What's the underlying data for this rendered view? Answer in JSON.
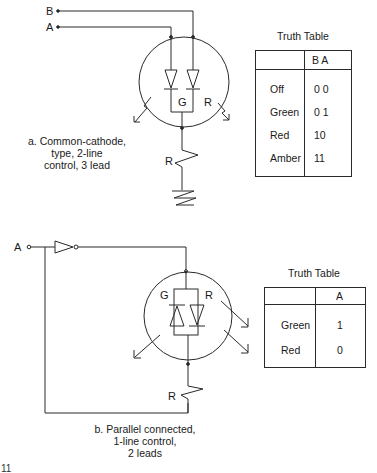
{
  "figure": {
    "top_circuit": {
      "input_labels": [
        "B",
        "A"
      ],
      "led_labels": [
        "G",
        "R"
      ],
      "resistor_label": "R",
      "caption": [
        "a. Common-cathode,",
        "type, 2-line",
        "control, 3 lead"
      ],
      "truth_table": {
        "title": "Truth Table",
        "header": [
          "",
          "B A"
        ],
        "rows": [
          {
            "state": "Off",
            "value": "0 0"
          },
          {
            "state": "Green",
            "value": "0 1"
          },
          {
            "state": "Red",
            "value": "10"
          },
          {
            "state": "Amber",
            "value": "11"
          }
        ]
      }
    },
    "bottom_circuit": {
      "input_label": "A",
      "led_labels": [
        "G",
        "R"
      ],
      "resistor_label": "R",
      "caption": [
        "b. Parallel connected,",
        "1-line control,",
        "2 leads"
      ],
      "truth_table": {
        "title": "Truth Table",
        "header": [
          "",
          "A"
        ],
        "rows": [
          {
            "state": "Green",
            "value": "1"
          },
          {
            "state": "Red",
            "value": "0"
          }
        ]
      }
    },
    "page_fragment": "11"
  },
  "colors": {
    "ink": "#1a1a1a",
    "background": "#ffffff"
  }
}
